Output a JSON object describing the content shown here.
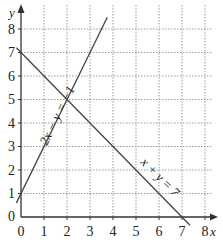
{
  "diagram": {
    "x_axis_label": "x",
    "y_axis_label": "y",
    "x_ticks": [
      "0",
      "1",
      "2",
      "3",
      "4",
      "5",
      "6",
      "7",
      "8"
    ],
    "y_ticks": [
      "0",
      "1",
      "2",
      "3",
      "4",
      "5",
      "6",
      "7",
      "8"
    ],
    "lines": [
      {
        "equation": "2x − y = −1",
        "label": "2x − y = −1"
      },
      {
        "equation": "x + y = 7",
        "label": "x + y = 7"
      }
    ],
    "intersection": {
      "x": 2,
      "y": 5
    },
    "colors": {
      "line": "#444444",
      "grid": "#9a9a9a",
      "axis": "#333333"
    }
  }
}
